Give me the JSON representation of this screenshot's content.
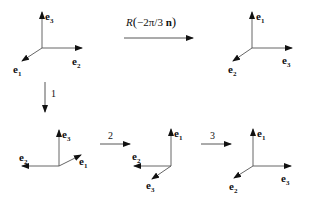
{
  "diagram": {
    "type": "rotation-decomposition",
    "main_transform": {
      "label_prefix": "R",
      "label_arg": "−2π/3 ",
      "label_vec": "n",
      "from": "frame-initial",
      "to": "frame-final"
    },
    "steps": [
      {
        "label": "1",
        "from": "frame-initial",
        "to": "frame-step1"
      },
      {
        "label": "2",
        "from": "frame-step1",
        "to": "frame-step2"
      },
      {
        "label": "3",
        "from": "frame-step2",
        "to": "frame-step3"
      }
    ],
    "frames": {
      "initial": {
        "up": {
          "base": "e",
          "sub": "3"
        },
        "right": {
          "base": "e",
          "sub": "2"
        },
        "diag": {
          "base": "e",
          "sub": "1"
        }
      },
      "final": {
        "up": {
          "base": "e",
          "sub": "1"
        },
        "right": {
          "base": "e",
          "sub": "3"
        },
        "diag": {
          "base": "e",
          "sub": "2"
        }
      },
      "step1": {
        "up": {
          "base": "e",
          "sub": "3"
        },
        "left": {
          "base": "e",
          "sub": "2"
        },
        "diag": {
          "base": "e",
          "sub": "1"
        }
      },
      "step2": {
        "up": {
          "base": "e",
          "sub": "1"
        },
        "left": {
          "base": "e",
          "sub": "2"
        },
        "diag": {
          "base": "e",
          "sub": "3"
        }
      },
      "step3": {
        "up": {
          "base": "e",
          "sub": "1"
        },
        "right": {
          "base": "e",
          "sub": "3"
        },
        "diag": {
          "base": "e",
          "sub": "2"
        }
      }
    },
    "colors": {
      "stroke": "#444444",
      "text": "#111111",
      "background": "#ffffff"
    }
  }
}
